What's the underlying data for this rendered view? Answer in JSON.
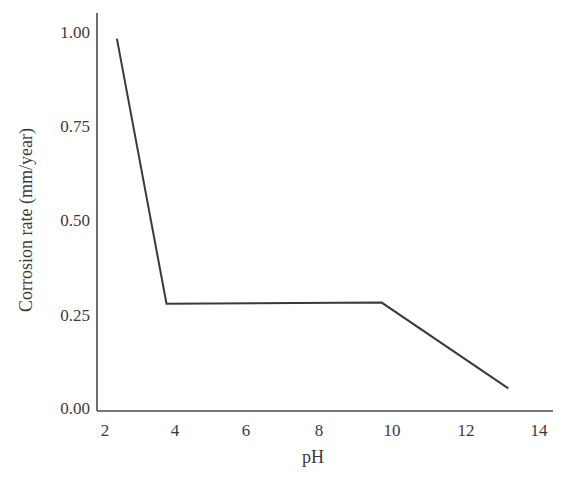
{
  "chart_data": {
    "type": "line",
    "title": "",
    "xlabel": "pH",
    "ylabel": "Corrosion rate (mm/year)",
    "xlim": [
      2,
      14
    ],
    "ylim": [
      0,
      1.0
    ],
    "grid": false,
    "legend": null,
    "x_ticks": [
      "2",
      "4",
      "6",
      "8",
      "10",
      "12",
      "14"
    ],
    "y_ticks": [
      "0.00",
      "0.25",
      "0.50",
      "0.75",
      "1.00"
    ],
    "series": [
      {
        "name": "Corrosion rate",
        "color": "#3a3a3a",
        "x": [
          2.33,
          3.7,
          9.65,
          13.15
        ],
        "y": [
          0.985,
          0.28,
          0.283,
          0.055
        ]
      }
    ]
  }
}
